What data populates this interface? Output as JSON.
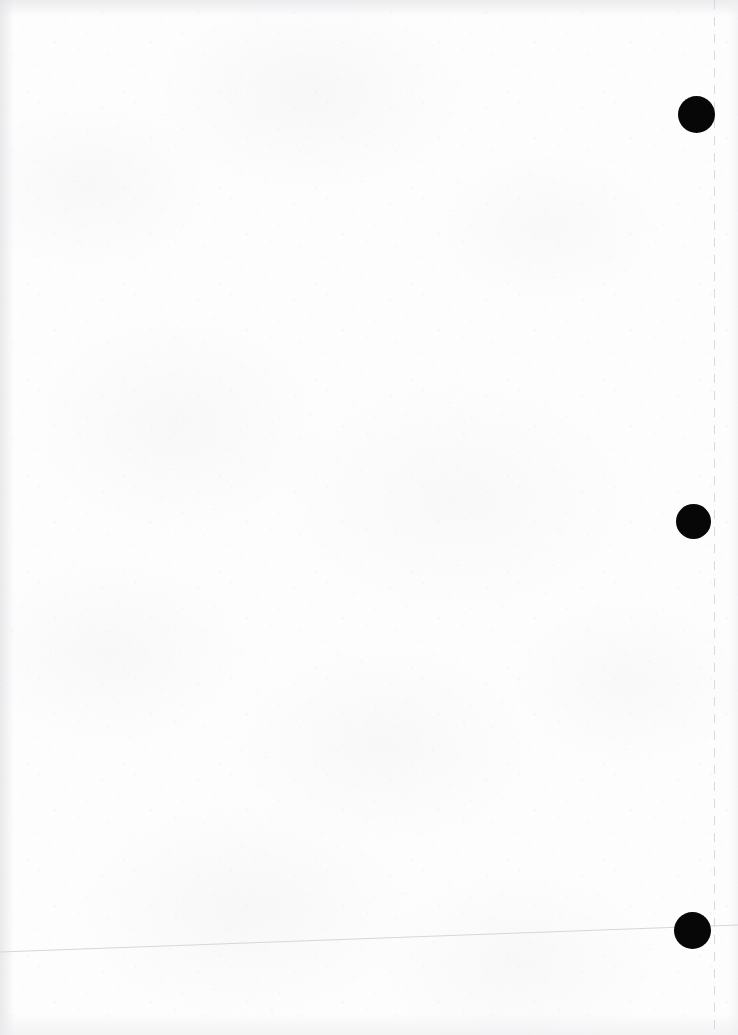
{
  "page": {
    "kind": "scanned-document-page",
    "width": 738,
    "height": 1035,
    "background_color": "#fdfdfd",
    "paper_tone_color": "#f4f4f6",
    "has_visible_text": false,
    "text_content": ""
  },
  "marks": {
    "ink_color": "#070707",
    "registration_dots": [
      {
        "label": "registration-dot-top",
        "cx": 696,
        "cy": 114,
        "diameter": 37
      },
      {
        "label": "registration-dot-middle",
        "cx": 693,
        "cy": 521,
        "diameter": 35
      },
      {
        "label": "registration-dot-bottom",
        "cx": 692,
        "cy": 930,
        "diameter": 37
      }
    ],
    "rule_line": {
      "label": "faint-horizontal-rule",
      "color": "#d6d6dc",
      "x_start": 0,
      "y_start": 952,
      "x_end": 738,
      "y_end": 925,
      "thickness": 1
    },
    "scan_edge_line": {
      "label": "dashed-vertical-scan-edge",
      "color": "#cdcdd4",
      "x": 714,
      "dash_on": 9,
      "dash_off": 8
    }
  },
  "shading": {
    "left_edge_color": "#e2e2e6",
    "top_edge_color": "#e5e5e9",
    "bottom_edge_color": "#ebebee",
    "right_edge_color": "#eeeef1"
  }
}
